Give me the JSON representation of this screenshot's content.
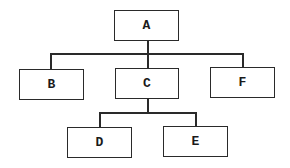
{
  "diagram": {
    "type": "tree",
    "nodes": [
      {
        "id": "A",
        "label": "A"
      },
      {
        "id": "B",
        "label": "B"
      },
      {
        "id": "C",
        "label": "C"
      },
      {
        "id": "F",
        "label": "F"
      },
      {
        "id": "D",
        "label": "D"
      },
      {
        "id": "E",
        "label": "E"
      }
    ],
    "edges": [
      {
        "from": "A",
        "to": "B"
      },
      {
        "from": "A",
        "to": "C"
      },
      {
        "from": "A",
        "to": "F"
      },
      {
        "from": "C",
        "to": "D"
      },
      {
        "from": "C",
        "to": "E"
      }
    ],
    "colors": {
      "line": "#2a2a2a",
      "background": "#ffffff",
      "text": "#1a1a1a"
    }
  }
}
